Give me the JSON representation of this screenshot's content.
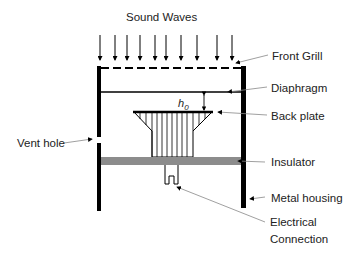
{
  "diagram": {
    "title": "Sound Waves",
    "labels": {
      "front_grill": "Front Grill",
      "diaphragm": "Diaphragm",
      "back_plate": "Back plate",
      "insulator": "Insulator",
      "metal_housing": "Metal housing",
      "electrical_connection_line1": "Electrical",
      "electrical_connection_line2": "Connection",
      "vent_hole": "Vent hole",
      "gap_symbol": "h",
      "gap_subscript": "0"
    },
    "sound_wave_arrow_count": 10,
    "colors": {
      "housing": "#000000",
      "insulator": "#8c8c8c",
      "leader_lines": "#888888",
      "text": "#222222"
    }
  }
}
